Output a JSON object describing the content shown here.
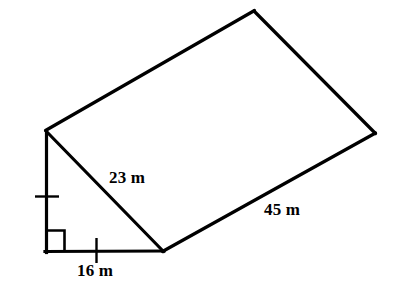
{
  "figure": {
    "shape_type": "triangular-prism",
    "background_color": "#ffffff",
    "stroke_color": "#000000",
    "stroke_width_px": 3,
    "units": "m"
  },
  "labels": {
    "slant": "23 m",
    "length": "45 m",
    "base": "16 m"
  },
  "measurements": [
    {
      "name": "hypotenuse",
      "value": 23,
      "unit": "m",
      "text": "23 m"
    },
    {
      "name": "prism-length",
      "value": 45,
      "unit": "m",
      "text": "45 m"
    },
    {
      "name": "triangle-base",
      "value": 16,
      "unit": "m",
      "text": "16 m"
    }
  ],
  "annotations": {
    "right_angle_marker": "right-angle-square",
    "tick_marks": [
      "tick-on-vertical-height-edge",
      "tick-on-horizontal-base-edge"
    ]
  },
  "geometry": {
    "vertices": {
      "front_apex": [
        46,
        131
      ],
      "front_bottom_left": [
        46,
        252
      ],
      "front_bottom_right": [
        163,
        251
      ],
      "back_apex": [
        254,
        11
      ],
      "back_bottom_right": [
        375,
        133
      ]
    },
    "edges": [
      {
        "name": "front-height-edge",
        "from": "front_apex",
        "to": "front_bottom_left"
      },
      {
        "name": "front-base-edge",
        "from": "front_bottom_left",
        "to": "front_bottom_right"
      },
      {
        "name": "front-hypotenuse-edge",
        "from": "front_apex",
        "to": "front_bottom_right"
      },
      {
        "name": "top-slant-face-edge",
        "from": "front_apex",
        "to": "back_apex"
      },
      {
        "name": "back-hypotenuse-edge",
        "from": "back_apex",
        "to": "back_bottom_right"
      },
      {
        "name": "bottom-length-edge",
        "from": "front_bottom_right",
        "to": "back_bottom_right"
      }
    ]
  }
}
